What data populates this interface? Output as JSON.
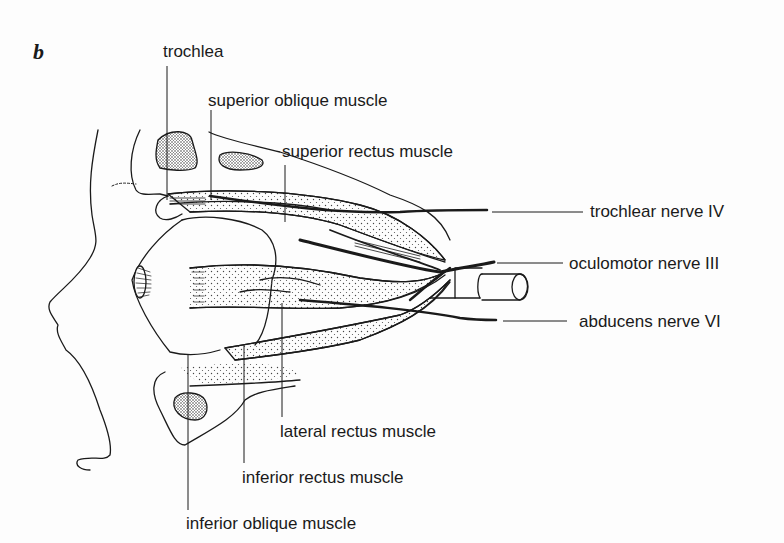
{
  "figure": {
    "panel_letter": "b"
  },
  "labels": {
    "trochlea": "trochlea",
    "superior_oblique": "superior oblique muscle",
    "superior_rectus": "superior rectus muscle",
    "trochlear_nerve": "trochlear nerve IV",
    "oculomotor_nerve": "oculomotor nerve III",
    "abducens_nerve": "abducens  nerve VI",
    "lateral_rectus": "lateral rectus muscle",
    "inferior_rectus": "inferior rectus muscle",
    "inferior_oblique": "inferior oblique muscle"
  },
  "colors": {
    "ink": "#1a1a1a",
    "background": "#fdfdfd",
    "stipple": "#444444"
  }
}
